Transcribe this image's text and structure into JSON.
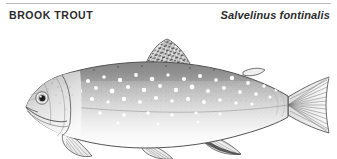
{
  "plate": {
    "width": 337,
    "height": 159,
    "background_color": "#ffffff",
    "rule_color": "#b9b9b9"
  },
  "header": {
    "common_name": "BROOK TROUT",
    "scientific_name": "Salvelinus fontinalis",
    "text_color": "#2b2b2b"
  },
  "illustration": {
    "subject": "brook-trout",
    "style": "pen-and-ink stipple line drawing, grayscale, left-facing fish in lateral view",
    "ink_color": "#4a4a4a",
    "body_shade_dark": "#8a8a8a",
    "body_shade_light": "#fdfdfd",
    "spot_color": "#ffffff",
    "dorsal_fin_pattern": "dark vermiculated bars",
    "parts": [
      "head",
      "eye",
      "mouth",
      "gill-cover",
      "body",
      "lateral-line",
      "pale-spots",
      "dorsal-fin",
      "adipose-fin",
      "pectoral-fin",
      "pelvic-fin",
      "anal-fin",
      "caudal-fin"
    ]
  }
}
